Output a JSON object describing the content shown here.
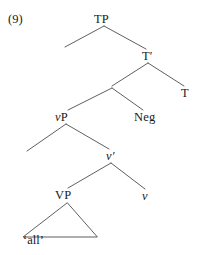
{
  "figure": {
    "example_number": "(9)",
    "kind": "syntax-tree",
    "line_color": "#4d4d4d",
    "text_color": "#1a1a1a",
    "background": "#ffffff"
  },
  "nodes": [
    {
      "id": "tp",
      "label": "TP",
      "style": "upright",
      "x": 104,
      "y": 19,
      "visible": true
    },
    {
      "id": "tp-spec",
      "label": "",
      "style": "upright",
      "x": 58,
      "y": 43,
      "visible": false
    },
    {
      "id": "tbar",
      "label": "T′",
      "style": "upright",
      "x": 148,
      "y": 56,
      "visible": true
    },
    {
      "id": "negp",
      "label": "",
      "style": "upright",
      "x": 112,
      "y": 88,
      "visible": false
    },
    {
      "id": "t",
      "label": "T",
      "style": "upright",
      "x": 185,
      "y": 93,
      "visible": true
    },
    {
      "id": "vp-little",
      "label": "vP",
      "style": "italic-first",
      "x": 63,
      "y": 117,
      "visible": true
    },
    {
      "id": "neg",
      "label": "Neg",
      "style": "upright",
      "x": 145,
      "y": 117,
      "visible": true
    },
    {
      "id": "vp-spec",
      "label": "",
      "style": "upright",
      "x": 26,
      "y": 154,
      "visible": false
    },
    {
      "id": "vbar",
      "label": "v′",
      "style": "italic",
      "x": 110,
      "y": 156,
      "visible": true
    },
    {
      "id": "vp-big",
      "label": "VP",
      "style": "upright",
      "x": 64,
      "y": 195,
      "visible": true
    },
    {
      "id": "v-head",
      "label": "v",
      "style": "italic",
      "x": 145,
      "y": 196,
      "visible": true
    }
  ],
  "terminals": [
    {
      "id": "all",
      "label": "‘all’",
      "x": 24,
      "y": 240
    }
  ]
}
